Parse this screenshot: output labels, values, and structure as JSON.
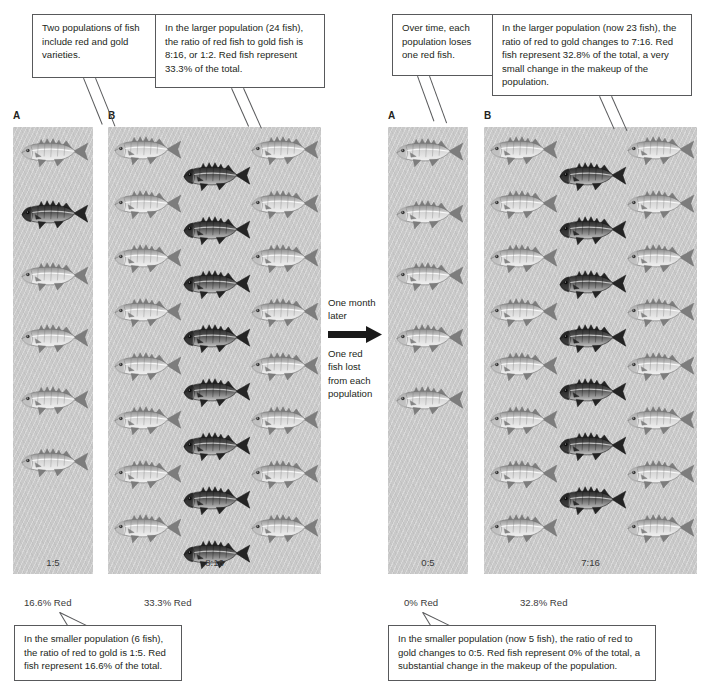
{
  "figure": {
    "background_color": "#ffffff",
    "panel_color": "#c9c9c9",
    "line_color": "#58595b"
  },
  "callouts": {
    "top_left": "Two populations of fish include red and gold varieties.",
    "top_center": "In the larger population (24 fish), the ratio of red fish to gold fish is 8:16, or 1:2. Red fish represent 33.3% of the total.",
    "top_right_small": "Over time, each population loses one red fish.",
    "top_right_large": "In the larger population (now 23 fish), the ratio of red to gold changes to 7:16. Red fish represent 32.8% of the total, a very small change in the makeup of the population.",
    "bottom_left": "In the smaller population (6 fish), the ratio of red to gold is 1:5. Red fish represent 16.6% of the total.",
    "bottom_right": "In the smaller population (now 5 fish), the ratio of red to gold changes to 0:5. Red fish represent 0% of the total, a substantial change in the makeup of the population."
  },
  "transition": {
    "line1": "One month",
    "line2": "later",
    "line3": "One red",
    "line4": "fish lost",
    "line5": "from each",
    "line6": "population",
    "arrow": "right-arrow-icon"
  },
  "panels": {
    "before_a": {
      "label": "A",
      "ratio": "1:5",
      "percent": "16.6% Red",
      "total_fish": 6,
      "red_fish": 1,
      "gold_fish": 5,
      "red_indices": [
        1
      ]
    },
    "before_b": {
      "label": "B",
      "ratio": "8:16",
      "percent": "33.3% Red",
      "total_fish": 24,
      "red_fish": 8,
      "gold_fish": 16,
      "red_column": "center"
    },
    "after_a": {
      "label": "A",
      "ratio": "0:5",
      "percent": "0% Red",
      "total_fish": 5,
      "red_fish": 0,
      "gold_fish": 5,
      "red_indices": []
    },
    "after_b": {
      "label": "B",
      "ratio": "7:16",
      "percent": "32.8% Red",
      "total_fish": 23,
      "red_fish": 7,
      "gold_fish": 16,
      "red_column": "center"
    }
  },
  "chart_data": {
    "type": "bar",
    "xlabel": "Population",
    "ylabel": "Percent red",
    "ylim": [
      0,
      40
    ],
    "categories": [
      "A (small)",
      "B (large)"
    ],
    "series": [
      {
        "name": "Before (one month earlier)",
        "values": [
          16.6,
          33.3
        ]
      },
      {
        "name": "After (one month later)",
        "values": [
          0,
          32.8
        ]
      }
    ],
    "annotations": [
      "A: 1:5 -> 0:5, 6 fish -> 5 fish",
      "B: 8:16 -> 7:16, 24 fish -> 23 fish"
    ],
    "grid": false,
    "legend": "none"
  }
}
